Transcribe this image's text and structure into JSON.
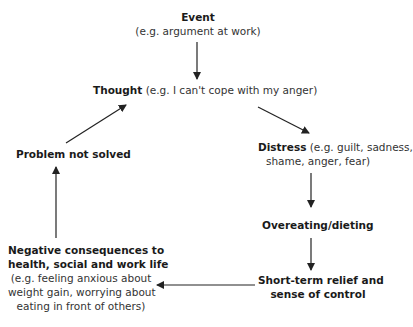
{
  "diagram": {
    "type": "cycle-flowchart",
    "nodes": {
      "event": {
        "title": "Event",
        "example": "(e.g. argument at work)"
      },
      "thought": {
        "title": "Thought",
        "example": "(e.g. I can't cope with my anger)"
      },
      "distress": {
        "title": "Distress",
        "example_line1": "(e.g. guilt, sadness,",
        "example_line2": "shame, anger, fear)"
      },
      "overeating": {
        "title": "Overeating/dieting"
      },
      "relief": {
        "title_line1": "Short-term relief and",
        "title_line2": "sense of control"
      },
      "consequences": {
        "title_line1": "Negative consequences to",
        "title_line2": "health, social and work life",
        "example_line1": "(e.g. feeling anxious about",
        "example_line2": "weight gain, worrying about",
        "example_line3": "eating in front of others)"
      },
      "problem": {
        "title": "Problem not solved"
      }
    },
    "edges": [
      [
        "Event",
        "Thought"
      ],
      [
        "Thought",
        "Distress"
      ],
      [
        "Distress",
        "Overeating/dieting"
      ],
      [
        "Overeating/dieting",
        "Short-term relief and sense of control"
      ],
      [
        "Short-term relief and sense of control",
        "Negative consequences to health, social and work life"
      ],
      [
        "Negative consequences to health, social and work life",
        "Problem not solved"
      ],
      [
        "Problem not solved",
        "Thought"
      ]
    ],
    "colors": {
      "text": "#1a1a1a",
      "arrow": "#222222",
      "background": "#ffffff"
    }
  }
}
